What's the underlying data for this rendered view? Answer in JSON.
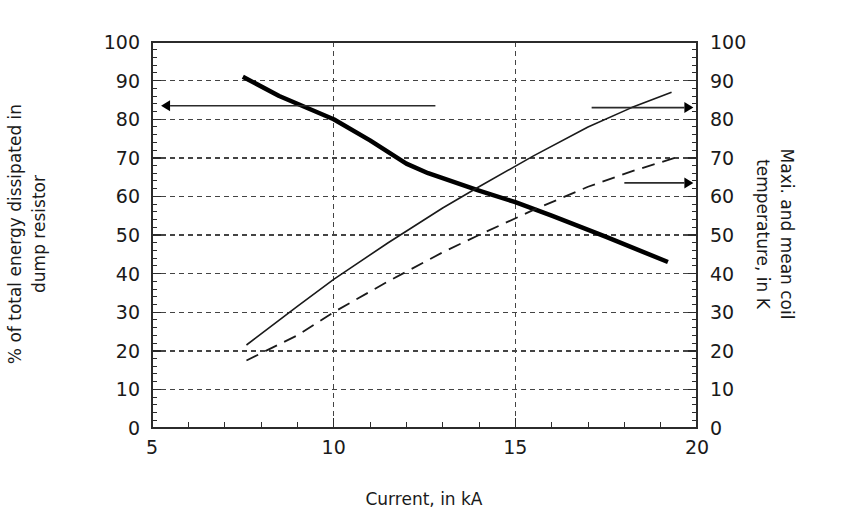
{
  "chart_data": {
    "type": "line",
    "title": "",
    "xlabel": "Current, in kA",
    "ylabel_left": "% of total energy dissipated in dump resistor",
    "ylabel_right": "Maxi. and mean coil temperature, in K",
    "xlim": [
      5,
      20
    ],
    "ylim_left": [
      0,
      100
    ],
    "ylim_right": [
      0,
      100
    ],
    "xticks": [
      5,
      10,
      15,
      20
    ],
    "xtick_labels": [
      "5",
      "10",
      "15",
      "20"
    ],
    "yticks_left": [
      0,
      10,
      20,
      30,
      40,
      50,
      60,
      70,
      80,
      90,
      100
    ],
    "ytick_labels_left": [
      "0",
      "10",
      "20",
      "30",
      "40",
      "50",
      "60",
      "70",
      "80",
      "90",
      "100"
    ],
    "yticks_right": [
      0,
      10,
      20,
      30,
      40,
      50,
      60,
      70,
      80,
      90,
      100
    ],
    "ytick_labels_right": [
      "0",
      "10",
      "20",
      "30",
      "40",
      "50",
      "60",
      "70",
      "80",
      "90",
      "100"
    ],
    "xtick_minor_step": 1,
    "ytick_minor_step": 2,
    "grid": true,
    "grid_style": "dotted",
    "grid_x_values": [
      10,
      15
    ],
    "grid_y_values": [
      10,
      20,
      30,
      40,
      50,
      60,
      70,
      80,
      90
    ],
    "legend_position": "none",
    "series": [
      {
        "name": "% of total energy dissipated in dump resistor",
        "axis": "left",
        "style": "solid-bold",
        "color": "#000000",
        "width": 4.5,
        "x": [
          7.5,
          8.5,
          10.0,
          11.0,
          12.0,
          12.6,
          14.0,
          15.0,
          16.0,
          17.5,
          19.2
        ],
        "y": [
          91.0,
          86.0,
          80.0,
          74.5,
          68.5,
          66.0,
          61.5,
          58.5,
          55.0,
          49.5,
          43.0
        ]
      },
      {
        "name": "Maxi. coil temperature, in K",
        "axis": "right",
        "style": "solid-thin",
        "color": "#1a1a1a",
        "width": 1.6,
        "x": [
          7.6,
          9.0,
          10.0,
          11.5,
          13.0,
          14.0,
          15.5,
          17.0,
          18.2,
          19.3
        ],
        "y": [
          21.5,
          31.5,
          38.5,
          48.0,
          57.0,
          62.5,
          70.5,
          78.0,
          83.0,
          87.0
        ]
      },
      {
        "name": "Mean coil temperature, in K",
        "axis": "right",
        "style": "dashed",
        "color": "#1a1a1a",
        "width": 1.8,
        "x": [
          7.6,
          9.0,
          10.0,
          11.5,
          13.0,
          14.0,
          15.5,
          17.0,
          18.2,
          19.4
        ],
        "y": [
          17.5,
          24.0,
          30.0,
          38.0,
          45.5,
          50.0,
          56.5,
          62.5,
          66.5,
          70.0
        ]
      }
    ],
    "annotations": [
      {
        "name": "left-axis-pointer",
        "type": "arrow",
        "direction": "left",
        "x_start": 12.8,
        "x_end": 5.25,
        "y_value": 83.5,
        "axis": "left"
      },
      {
        "name": "right-axis-pointer-upper",
        "type": "arrow",
        "direction": "right",
        "x_start": 17.1,
        "x_end": 19.9,
        "y_value": 83.0,
        "axis": "right"
      },
      {
        "name": "right-axis-pointer-lower",
        "type": "arrow",
        "direction": "right",
        "x_start": 18.0,
        "x_end": 19.9,
        "y_value": 63.5,
        "axis": "right"
      }
    ]
  },
  "plot_geometry": {
    "left": 152,
    "right": 697,
    "top": 42,
    "bottom": 428
  },
  "colors": {
    "axis": "#2b2b2b",
    "grid": "#444444",
    "background": "#ffffff",
    "text": "#1a1a1a"
  }
}
